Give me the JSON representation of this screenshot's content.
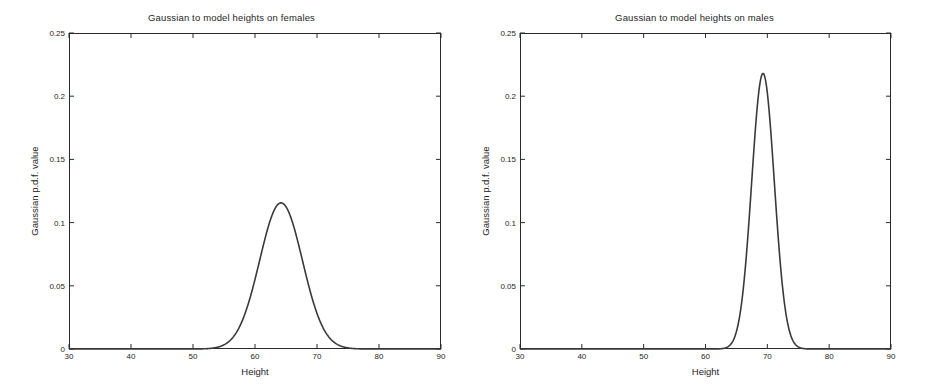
{
  "figure": {
    "background": "#ffffff",
    "curve_color": "#3a3a3a",
    "axis_color": "#2a2a2a",
    "width": 927,
    "height": 392
  },
  "chart_data": [
    {
      "type": "line",
      "panel": "left",
      "title": "Gaussian to model heights on females",
      "xlabel": "Height",
      "ylabel": "Gaussian p.d.f. value",
      "xlim": [
        30,
        90
      ],
      "ylim": [
        0,
        0.25
      ],
      "xticks": [
        30,
        40,
        50,
        60,
        70,
        80,
        90
      ],
      "xtick_labels": [
        "30",
        "40",
        "50",
        "60",
        "70",
        "80",
        "90"
      ],
      "yticks": [
        0,
        0.05,
        0.1,
        0.15,
        0.2,
        0.25
      ],
      "ytick_labels": [
        "0",
        "0.05",
        "0.1",
        "0.15",
        "0.2",
        "0.25"
      ],
      "grid": false,
      "legend": null,
      "series": [
        {
          "name": "female height pdf",
          "distribution": "gaussian",
          "mean": 64.2,
          "sigma": 3.45,
          "peak_value": 0.1156,
          "peak_x": 64.2,
          "color": "#3a3a3a"
        }
      ]
    },
    {
      "type": "line",
      "panel": "right",
      "title": "Gaussian to model heights on males",
      "xlabel": "Height",
      "ylabel": "Gaussian p.d.f. value",
      "xlim": [
        30,
        90
      ],
      "ylim": [
        0,
        0.25
      ],
      "xticks": [
        30,
        40,
        50,
        60,
        70,
        80,
        90
      ],
      "xtick_labels": [
        "30",
        "40",
        "50",
        "60",
        "70",
        "80",
        "90"
      ],
      "yticks": [
        0,
        0.05,
        0.1,
        0.15,
        0.2,
        0.25
      ],
      "ytick_labels": [
        "0",
        "0.05",
        "0.1",
        "0.15",
        "0.2",
        "0.25"
      ],
      "grid": false,
      "legend": null,
      "series": [
        {
          "name": "male height pdf",
          "distribution": "gaussian",
          "mean": 69.3,
          "sigma": 1.83,
          "peak_value": 0.218,
          "peak_x": 69.3,
          "color": "#3a3a3a"
        }
      ]
    }
  ]
}
